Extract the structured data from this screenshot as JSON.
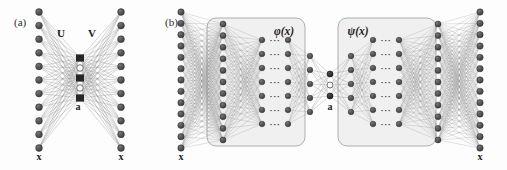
{
  "figure": {
    "width": 507,
    "height": 170,
    "background": "#fdfdfd"
  },
  "colors": {
    "node_dark": "#4a4a4a",
    "node_edge": "#2e2e2e",
    "node_bottleneck_dark": "#2a2a2a",
    "node_bottleneck_light": "#fbfbfb",
    "edge_line": "#8e8e8e",
    "box_fill": "#f0f0f0",
    "box_stroke": "#9a9a9a",
    "text": "#1d1d1d"
  },
  "panel_a": {
    "label": "(a)",
    "weight_label_encoder": "U",
    "weight_label_decoder": "V",
    "code_label": "a",
    "input_label": "x",
    "output_label": "x",
    "input_units": 11,
    "output_units": 11,
    "bottleneck_units": 5,
    "bottleneck_pattern": [
      "dark",
      "light",
      "dark",
      "light",
      "dark"
    ]
  },
  "panel_b": {
    "label": "(b)",
    "encoder_label": "φ(x)",
    "decoder_label": "ψ(x)",
    "code_label": "a",
    "input_label": "x",
    "output_label": "x",
    "input_units": 13,
    "output_units": 13,
    "bottleneck_units": 3,
    "bottleneck_pattern": [
      "dark",
      "light",
      "dark"
    ],
    "ellipsis": "···",
    "ellipsis_rows": 7,
    "encoder_layers": [
      13,
      11,
      7,
      7,
      5
    ],
    "decoder_layers": [
      5,
      7,
      7,
      11,
      13
    ]
  }
}
